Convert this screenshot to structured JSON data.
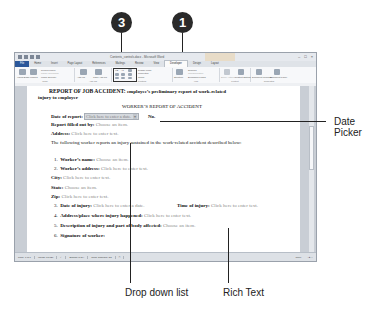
{
  "window": {
    "title": "Contents_controls.docx - Microsoft Word",
    "controls": [
      "–",
      "□",
      "×"
    ]
  },
  "tabs": [
    {
      "label": "File",
      "state": "file"
    },
    {
      "label": "Home"
    },
    {
      "label": "Insert"
    },
    {
      "label": "Page Layout"
    },
    {
      "label": "References"
    },
    {
      "label": "Mailings"
    },
    {
      "label": "Review"
    },
    {
      "label": "View"
    },
    {
      "label": "Developer",
      "state": "active"
    },
    {
      "label": "Design"
    },
    {
      "label": "Layout"
    }
  ],
  "ribbon": {
    "code": {
      "label": "Code",
      "visual_basic": "Visual Basic",
      "macros": "Macros",
      "record_macro": "Record Macro",
      "pause_recording": "Pause Recording",
      "macro_security": "Macro Security"
    },
    "addins": {
      "label": "Add-Ins",
      "addins": "Add-Ins",
      "com_addins": "COM Add-Ins"
    },
    "controls": {
      "label": "Controls",
      "design_mode": "Design Mode",
      "properties": "Properties",
      "group": "Group"
    },
    "xml": {
      "label": "XML",
      "structure": "Structure",
      "schema": "Schema",
      "transformation": "Transformation",
      "expansion_packs": "Expansion Packs"
    },
    "protect": {
      "label": "Protect",
      "block_authors": "Block Authors",
      "restrict_editing": "Restrict Editing"
    },
    "templates": {
      "label": "Templates",
      "document_template": "Document Template",
      "document_panel": "Document Panel"
    }
  },
  "document": {
    "heading": "REPORT OF JOB ACCIDENT:",
    "heading_rest": "employee’s preliminary report of work-related",
    "heading_line2": "injury to employer",
    "subtitle": "WORKER’S REPORT OF ACCIDENT",
    "date_of_report_label": "Date of report:",
    "date_picker_placeholder": "Click here to enter a date.",
    "no_label": "No.",
    "report_filled_label": "Report filled out by:",
    "choose_item": "Choose an item.",
    "address_label": "Address:",
    "click_here": "Click here to enter text.",
    "paragraph": "The following worker reports an injury sustained in the work-related accident described below:",
    "items": [
      {
        "num": "1.",
        "label": "Worker’s name:",
        "placeholder": "Choose an item."
      },
      {
        "num": "2.",
        "label": "Worker’s address:",
        "placeholder": "Click here to enter text."
      }
    ],
    "city_label": "City:",
    "city_placeholder": "Click here to enter text.",
    "state_label": "State:",
    "state_placeholder": "Choose an item.",
    "zip_label": "Zip:",
    "zip_placeholder": "Click here to enter text.",
    "item3_num": "3.",
    "item3_label": "Date of injury:",
    "item3_placeholder": "Click here to enter a date.",
    "time_label": "Time of injury:",
    "time_placeholder": "Click here to enter text.",
    "item4_num": "4.",
    "item4_label": "Address/place where injury happened:",
    "item4_placeholder": "Click here to enter text.",
    "item5_num": "5.",
    "item5_label": "Description of injury and part of body affected:",
    "item5_placeholder": "Choose an item.",
    "item6_num": "6.",
    "item6_label": "Signature of worker:"
  },
  "statusbar": {
    "page": "Page: 1 of 1",
    "words": "Words: 81/126",
    "language": "English (U.S.)",
    "track_changes": "Track Changes: Off",
    "zoom": "100%"
  },
  "callouts": {
    "one": "1",
    "three": "3",
    "date_picker": "Date\nPicker",
    "date_picker_l1": "Date",
    "date_picker_l2": "Picker",
    "drop_down": "Drop down list",
    "rich_text": "Rich Text"
  }
}
